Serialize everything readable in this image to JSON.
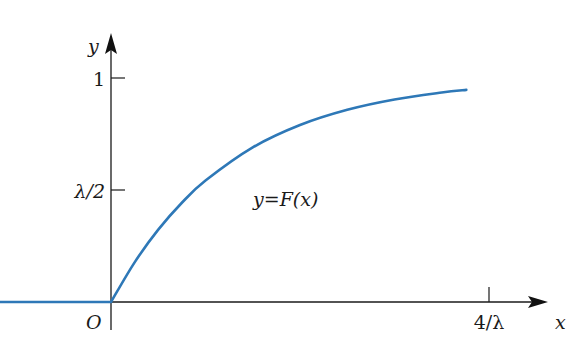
{
  "chart_data": {
    "type": "line",
    "title": "",
    "xlabel": "x",
    "ylabel": "y",
    "origin_label": "O",
    "function_label": "y=F(x)",
    "x_ticks": [
      {
        "value": 4,
        "label": "4/λ"
      }
    ],
    "y_ticks": [
      {
        "value": 1,
        "label": "1"
      },
      {
        "value": 0.5,
        "label": "λ/2"
      }
    ],
    "x_unit": "1/λ",
    "xlim": [
      -2,
      4.6
    ],
    "ylim": [
      0,
      1.2
    ],
    "grid": false,
    "legend": "none",
    "series": [
      {
        "name": "F(x)",
        "color": "#2e78b7",
        "x": [
          -2,
          -1,
          0,
          0.25,
          0.5,
          0.75,
          1,
          1.5,
          2,
          2.5,
          3,
          3.5,
          3.76
        ],
        "y": [
          0,
          0,
          0,
          0.177,
          0.323,
          0.443,
          0.542,
          0.69,
          0.79,
          0.858,
          0.904,
          0.935,
          0.947
        ]
      }
    ]
  }
}
